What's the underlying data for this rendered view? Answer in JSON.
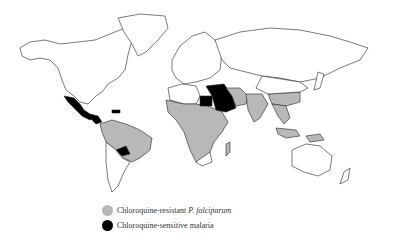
{
  "map": {
    "type": "world choropleth",
    "colors": {
      "land": "#ffffff",
      "border": "#222222",
      "resistant": "#b8b8b8",
      "sensitive": "#000000"
    },
    "regions": {
      "chloroquine_resistant": [
        "South America (Brazil, Colombia, Venezuela, Peru, Bolivia)",
        "Sub-Saharan Africa",
        "Indian subcontinent",
        "Southeast Asia",
        "Southern China",
        "Indonesia/New Guinea"
      ],
      "chloroquine_sensitive": [
        "Mexico",
        "Central America",
        "Haiti/Dominican Republic",
        "Paraguay",
        "Egypt",
        "Middle East (Arabian Peninsula, Iraq, Iran)"
      ]
    }
  },
  "legend": {
    "items": [
      {
        "label_prefix": "Chloroquine-resistant ",
        "label_italic": "P. falciparum",
        "color": "#b8b8b8"
      },
      {
        "label_prefix": "Chloroquine-sensitive malaria",
        "label_italic": "",
        "color": "#000000"
      }
    ]
  }
}
